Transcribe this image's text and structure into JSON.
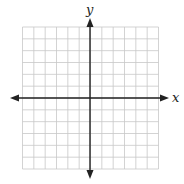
{
  "figure": {
    "type": "coordinate-plane",
    "grid": {
      "columns": 12,
      "rows": 12,
      "color": "#c8c8c8"
    },
    "axes": {
      "color": "#222222",
      "x_label": "x",
      "y_label": "y"
    },
    "arrows": [
      "left",
      "right",
      "up",
      "down"
    ]
  }
}
